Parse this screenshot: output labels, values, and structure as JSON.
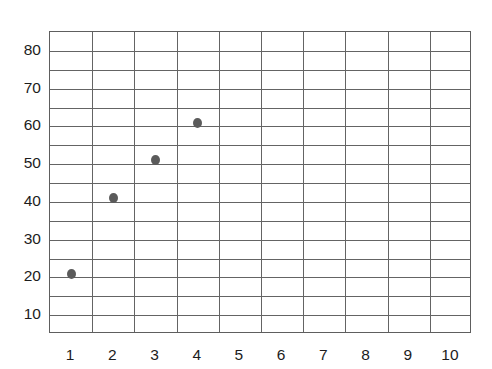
{
  "chart_data": {
    "type": "scatter",
    "title": "",
    "subtitle": "",
    "xlabel": "",
    "ylabel": "",
    "xlim": [
      0.5,
      10.5
    ],
    "ylim": [
      5,
      85
    ],
    "grid": true,
    "legend": null,
    "legend_position": "none",
    "point_color": "#5b5b5b",
    "gridline_color": "#646464",
    "border_color": "#5e5e5e",
    "background_color": "#ffffff",
    "x_tick_labels": [
      "1",
      "2",
      "3",
      "4",
      "5",
      "6",
      "7",
      "8",
      "9",
      "10"
    ],
    "x_tick_values": [
      1,
      2,
      3,
      4,
      5,
      6,
      7,
      8,
      9,
      10
    ],
    "y_tick_labels": [
      "80",
      "70",
      "60",
      "50",
      "40",
      "30",
      "20",
      "10"
    ],
    "y_tick_values": [
      80,
      70,
      60,
      50,
      40,
      30,
      20,
      10
    ],
    "y_minor_gridlines": [
      85,
      80,
      75,
      70,
      65,
      60,
      55,
      50,
      45,
      40,
      35,
      30,
      25,
      20,
      15,
      10
    ],
    "series": [
      {
        "name": "data",
        "points": [
          {
            "x": 1,
            "y": 21
          },
          {
            "x": 2,
            "y": 41
          },
          {
            "x": 3,
            "y": 51
          },
          {
            "x": 4,
            "y": 61
          }
        ]
      }
    ]
  }
}
